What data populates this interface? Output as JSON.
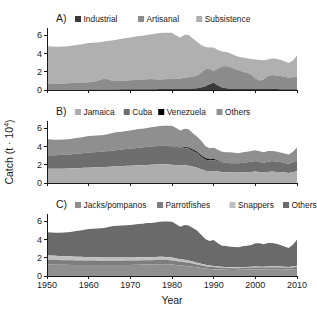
{
  "figure": {
    "width": 317,
    "height": 323,
    "background": "#ffffff"
  },
  "axes": {
    "ylabel_main": "Catch (t",
    "ylabel_mid": " · 10",
    "ylabel_exp": "4",
    "ylabel_close": ")",
    "xlabel": "Year",
    "yticks": [
      "0",
      "2",
      "4",
      "6"
    ],
    "xticks": [
      "1950",
      "1960",
      "1970",
      "1980",
      "1990",
      "2000",
      "2010"
    ]
  },
  "panels": [
    {
      "id": "A",
      "label": "A)"
    },
    {
      "id": "B",
      "label": "B)"
    },
    {
      "id": "C",
      "label": "C)"
    }
  ],
  "legends": {
    "A": [
      {
        "label": "Industrial",
        "color": "#3a3a3a"
      },
      {
        "label": "Artisanal",
        "color": "#8c8c8c"
      },
      {
        "label": "Subsistence",
        "color": "#b0b0b0"
      }
    ],
    "B": [
      {
        "label": "Jamaica",
        "color": "#adadad"
      },
      {
        "label": "Cuba",
        "color": "#6e6e6e"
      },
      {
        "label": "Venezuela",
        "color": "#000000"
      },
      {
        "label": "Others",
        "color": "#8f8f8f"
      }
    ],
    "C": [
      {
        "label": "Jacks/pompanos",
        "color": "#8f8f8f"
      },
      {
        "label": "Parrotfishes",
        "color": "#7d7d7d"
      },
      {
        "label": "Snappers",
        "color": "#c0c0c0"
      },
      {
        "label": "Others",
        "color": "#6a6a6a"
      }
    ]
  },
  "chart_data": [
    {
      "type": "area",
      "panel": "A",
      "title": "Caribbean reef fisheries catch by sector",
      "xlabel": "Year",
      "ylabel": "Catch (t · 10^4)",
      "xlim": [
        1950,
        2010
      ],
      "ylim": [
        0,
        6.8
      ],
      "grid": false,
      "legend_position": "top",
      "stacked": true,
      "x": [
        1950,
        1951,
        1952,
        1953,
        1954,
        1955,
        1956,
        1957,
        1958,
        1959,
        1960,
        1961,
        1962,
        1963,
        1964,
        1965,
        1966,
        1967,
        1968,
        1969,
        1970,
        1971,
        1972,
        1973,
        1974,
        1975,
        1976,
        1977,
        1978,
        1979,
        1980,
        1981,
        1982,
        1983,
        1984,
        1985,
        1986,
        1987,
        1988,
        1989,
        1990,
        1991,
        1992,
        1993,
        1994,
        1995,
        1996,
        1997,
        1998,
        1999,
        2000,
        2001,
        2002,
        2003,
        2004,
        2005,
        2006,
        2007,
        2008,
        2009,
        2010
      ],
      "series": [
        {
          "name": "Industrial",
          "values": [
            0.03,
            0.03,
            0.03,
            0.03,
            0.03,
            0.03,
            0.04,
            0.04,
            0.04,
            0.04,
            0.05,
            0.05,
            0.05,
            0.05,
            0.06,
            0.06,
            0.06,
            0.06,
            0.07,
            0.07,
            0.07,
            0.08,
            0.08,
            0.08,
            0.09,
            0.09,
            0.09,
            0.1,
            0.1,
            0.1,
            0.11,
            0.11,
            0.12,
            0.13,
            0.14,
            0.16,
            0.2,
            0.28,
            0.42,
            0.62,
            0.8,
            0.5,
            0.28,
            0.18,
            0.14,
            0.12,
            0.11,
            0.11,
            0.1,
            0.1,
            0.1,
            0.1,
            0.1,
            0.1,
            0.1,
            0.1,
            0.09,
            0.09,
            0.09,
            0.09,
            0.09
          ]
        },
        {
          "name": "Artisanal",
          "values": [
            0.62,
            0.63,
            0.64,
            0.66,
            0.68,
            0.7,
            0.72,
            0.74,
            0.76,
            0.78,
            0.8,
            0.85,
            0.95,
            1.1,
            1.2,
            1.05,
            0.95,
            0.92,
            0.95,
            0.98,
            1.0,
            1.02,
            1.05,
            1.08,
            1.1,
            1.12,
            1.1,
            1.05,
            1.08,
            1.12,
            1.15,
            1.12,
            1.15,
            1.2,
            1.25,
            1.3,
            1.4,
            1.6,
            1.85,
            1.7,
            1.25,
            1.85,
            2.3,
            2.45,
            2.38,
            2.2,
            2.05,
            1.9,
            1.78,
            1.6,
            1.2,
            0.95,
            1.05,
            1.4,
            1.55,
            1.5,
            1.45,
            1.35,
            1.25,
            1.3,
            1.4
          ]
        },
        {
          "name": "Subsistence",
          "values": [
            4.15,
            4.1,
            4.08,
            4.06,
            4.05,
            4.07,
            4.1,
            4.15,
            4.2,
            4.25,
            4.3,
            4.28,
            4.2,
            4.12,
            4.1,
            4.3,
            4.45,
            4.55,
            4.6,
            4.65,
            4.7,
            4.75,
            4.78,
            4.8,
            4.85,
            4.9,
            4.98,
            5.1,
            5.1,
            5.05,
            5.02,
            4.75,
            4.5,
            4.72,
            4.65,
            4.2,
            3.7,
            3.05,
            2.45,
            2.35,
            2.6,
            2.05,
            1.65,
            1.55,
            1.5,
            1.5,
            1.5,
            1.55,
            1.6,
            1.7,
            2.05,
            2.25,
            2.1,
            1.85,
            1.8,
            1.82,
            1.78,
            1.7,
            1.62,
            1.85,
            2.3
          ]
        }
      ]
    },
    {
      "type": "area",
      "panel": "B",
      "title": "Caribbean reef fisheries catch by country",
      "xlabel": "Year",
      "ylabel": "Catch (t · 10^4)",
      "xlim": [
        1950,
        2010
      ],
      "ylim": [
        0,
        6.8
      ],
      "grid": false,
      "legend_position": "top",
      "stacked": true,
      "x": [
        1950,
        1951,
        1952,
        1953,
        1954,
        1955,
        1956,
        1957,
        1958,
        1959,
        1960,
        1961,
        1962,
        1963,
        1964,
        1965,
        1966,
        1967,
        1968,
        1969,
        1970,
        1971,
        1972,
        1973,
        1974,
        1975,
        1976,
        1977,
        1978,
        1979,
        1980,
        1981,
        1982,
        1983,
        1984,
        1985,
        1986,
        1987,
        1988,
        1989,
        1990,
        1991,
        1992,
        1993,
        1994,
        1995,
        1996,
        1997,
        1998,
        1999,
        2000,
        2001,
        2002,
        2003,
        2004,
        2005,
        2006,
        2007,
        2008,
        2009,
        2010
      ],
      "series": [
        {
          "name": "Jamaica",
          "values": [
            1.55,
            1.55,
            1.55,
            1.56,
            1.57,
            1.58,
            1.6,
            1.62,
            1.64,
            1.66,
            1.68,
            1.7,
            1.72,
            1.74,
            1.76,
            1.78,
            1.8,
            1.82,
            1.85,
            1.88,
            1.9,
            1.92,
            1.94,
            1.96,
            1.98,
            2.0,
            2.02,
            2.05,
            2.05,
            2.02,
            2.0,
            1.95,
            1.92,
            1.95,
            1.9,
            1.8,
            1.68,
            1.5,
            1.35,
            1.28,
            1.3,
            1.25,
            1.2,
            1.18,
            1.15,
            1.15,
            1.15,
            1.18,
            1.2,
            1.22,
            1.25,
            1.2,
            1.18,
            1.22,
            1.25,
            1.22,
            1.2,
            1.15,
            1.1,
            1.18,
            1.3
          ]
        },
        {
          "name": "Cuba",
          "values": [
            1.5,
            1.5,
            1.5,
            1.51,
            1.52,
            1.54,
            1.56,
            1.58,
            1.6,
            1.62,
            1.65,
            1.66,
            1.68,
            1.7,
            1.72,
            1.74,
            1.77,
            1.8,
            1.82,
            1.85,
            1.88,
            1.9,
            1.92,
            1.95,
            1.97,
            2.0,
            2.02,
            2.05,
            2.05,
            2.03,
            2.0,
            1.92,
            1.85,
            1.9,
            1.88,
            1.75,
            1.6,
            1.4,
            1.22,
            1.18,
            1.22,
            1.15,
            1.08,
            1.05,
            1.02,
            1.02,
            1.02,
            1.05,
            1.08,
            1.1,
            1.15,
            1.1,
            1.05,
            1.12,
            1.15,
            1.12,
            1.1,
            1.05,
            1.0,
            1.08,
            1.2
          ]
        },
        {
          "name": "Venezuela",
          "values": [
            0.0,
            0.0,
            0.0,
            0.0,
            0.0,
            0.0,
            0.0,
            0.0,
            0.0,
            0.0,
            0.0,
            0.0,
            0.0,
            0.0,
            0.0,
            0.0,
            0.0,
            0.0,
            0.0,
            0.0,
            0.0,
            0.0,
            0.0,
            0.0,
            0.0,
            0.0,
            0.0,
            0.0,
            0.0,
            0.0,
            0.02,
            0.04,
            0.06,
            0.08,
            0.1,
            0.12,
            0.14,
            0.15,
            0.16,
            0.14,
            0.1,
            0.06,
            0.03,
            0.0,
            0.0,
            0.0,
            0.0,
            0.0,
            0.0,
            0.0,
            0.0,
            0.0,
            0.0,
            0.0,
            0.0,
            0.0,
            0.0,
            0.0,
            0.0,
            0.0,
            0.0
          ]
        },
        {
          "name": "Others",
          "values": [
            1.75,
            1.71,
            1.7,
            1.68,
            1.67,
            1.68,
            1.7,
            1.73,
            1.76,
            1.79,
            1.82,
            1.82,
            1.8,
            1.81,
            1.81,
            1.89,
            1.94,
            1.96,
            1.95,
            1.97,
            1.99,
            2.03,
            2.05,
            2.05,
            2.09,
            2.11,
            2.13,
            2.15,
            2.18,
            2.22,
            2.26,
            2.11,
            1.94,
            2.02,
            2.01,
            1.79,
            1.68,
            1.58,
            1.34,
            1.22,
            1.25,
            1.18,
            1.12,
            1.15,
            1.2,
            1.15,
            1.1,
            1.13,
            1.15,
            1.18,
            1.2,
            1.18,
            1.15,
            1.18,
            1.12,
            1.12,
            1.05,
            1.04,
            1.03,
            1.18,
            1.38
          ]
        }
      ]
    },
    {
      "type": "area",
      "panel": "C",
      "title": "Caribbean reef fisheries catch by taxon",
      "xlabel": "Year",
      "ylabel": "Catch (t · 10^4)",
      "xlim": [
        1950,
        2010
      ],
      "ylim": [
        0,
        6.8
      ],
      "grid": false,
      "legend_position": "top",
      "stacked": true,
      "x": [
        1950,
        1951,
        1952,
        1953,
        1954,
        1955,
        1956,
        1957,
        1958,
        1959,
        1960,
        1961,
        1962,
        1963,
        1964,
        1965,
        1966,
        1967,
        1968,
        1969,
        1970,
        1971,
        1972,
        1973,
        1974,
        1975,
        1976,
        1977,
        1978,
        1979,
        1980,
        1981,
        1982,
        1983,
        1984,
        1985,
        1986,
        1987,
        1988,
        1989,
        1990,
        1991,
        1992,
        1993,
        1994,
        1995,
        1996,
        1997,
        1998,
        1999,
        2000,
        2001,
        2002,
        2003,
        2004,
        2005,
        2006,
        2007,
        2008,
        2009,
        2010
      ],
      "series": [
        {
          "name": "Jacks/pompanos",
          "values": [
            1.25,
            1.25,
            1.24,
            1.24,
            1.23,
            1.23,
            1.22,
            1.22,
            1.22,
            1.21,
            1.21,
            1.21,
            1.2,
            1.2,
            1.2,
            1.2,
            1.2,
            1.21,
            1.21,
            1.22,
            1.22,
            1.23,
            1.24,
            1.25,
            1.26,
            1.27,
            1.28,
            1.3,
            1.3,
            1.28,
            1.25,
            1.2,
            1.15,
            1.12,
            1.08,
            1.02,
            0.95,
            0.88,
            0.82,
            0.78,
            0.75,
            0.72,
            0.7,
            0.68,
            0.67,
            0.67,
            0.68,
            0.69,
            0.7,
            0.72,
            0.73,
            0.72,
            0.72,
            0.74,
            0.75,
            0.74,
            0.73,
            0.72,
            0.7,
            0.74,
            0.8
          ]
        },
        {
          "name": "Parrotfishes",
          "values": [
            0.52,
            0.52,
            0.51,
            0.51,
            0.5,
            0.5,
            0.5,
            0.49,
            0.49,
            0.49,
            0.48,
            0.48,
            0.48,
            0.48,
            0.47,
            0.47,
            0.47,
            0.47,
            0.47,
            0.47,
            0.47,
            0.47,
            0.47,
            0.47,
            0.47,
            0.47,
            0.47,
            0.48,
            0.48,
            0.47,
            0.46,
            0.44,
            0.42,
            0.4,
            0.38,
            0.35,
            0.32,
            0.29,
            0.26,
            0.24,
            0.23,
            0.21,
            0.2,
            0.19,
            0.18,
            0.18,
            0.18,
            0.19,
            0.19,
            0.2,
            0.2,
            0.2,
            0.2,
            0.2,
            0.21,
            0.2,
            0.2,
            0.2,
            0.19,
            0.2,
            0.22
          ]
        },
        {
          "name": "Snappers",
          "values": [
            0.48,
            0.47,
            0.46,
            0.45,
            0.44,
            0.43,
            0.42,
            0.41,
            0.4,
            0.39,
            0.38,
            0.37,
            0.37,
            0.36,
            0.36,
            0.35,
            0.35,
            0.35,
            0.35,
            0.35,
            0.34,
            0.34,
            0.34,
            0.34,
            0.34,
            0.34,
            0.34,
            0.34,
            0.33,
            0.32,
            0.31,
            0.29,
            0.27,
            0.25,
            0.23,
            0.21,
            0.19,
            0.17,
            0.15,
            0.14,
            0.13,
            0.12,
            0.11,
            0.1,
            0.1,
            0.1,
            0.1,
            0.1,
            0.1,
            0.1,
            0.1,
            0.1,
            0.1,
            0.1,
            0.1,
            0.1,
            0.1,
            0.1,
            0.1,
            0.1,
            0.11
          ]
        },
        {
          "name": "Others",
          "values": [
            2.55,
            2.52,
            2.54,
            2.55,
            2.59,
            2.64,
            2.72,
            2.81,
            2.89,
            2.99,
            3.08,
            3.12,
            3.15,
            3.21,
            3.27,
            3.39,
            3.46,
            3.47,
            3.5,
            3.53,
            3.57,
            3.62,
            3.66,
            3.68,
            3.73,
            3.74,
            3.78,
            3.83,
            3.87,
            3.9,
            3.92,
            3.75,
            3.57,
            3.83,
            3.85,
            3.68,
            3.52,
            3.19,
            2.83,
            2.67,
            2.84,
            2.55,
            2.31,
            2.31,
            2.27,
            2.22,
            2.2,
            2.28,
            2.34,
            2.38,
            2.57,
            2.56,
            2.46,
            2.58,
            2.56,
            2.5,
            2.37,
            2.22,
            2.07,
            2.4,
            2.85
          ]
        }
      ]
    }
  ]
}
